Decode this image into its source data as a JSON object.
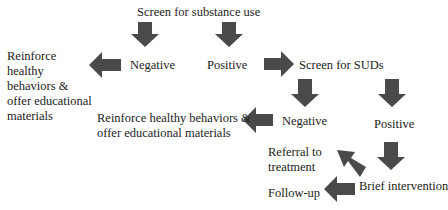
{
  "diagram": {
    "type": "flowchart",
    "arrow_color": "#4a4a4a",
    "nodes": {
      "screen_substance": "Screen for substance use",
      "negative_1": "Negative",
      "positive_1": "Positive",
      "reinforce_1": "Reinforce healthy behaviors & offer educational materials",
      "screen_suds": "Screen for SUDs",
      "negative_2": "Negative",
      "positive_2": "Positive",
      "reinforce_2_line1": "Reinforce healthy behaviors &",
      "reinforce_2_line2": "offer educational materials",
      "referral_line1": "Referral to",
      "referral_line2": "treatment",
      "brief_intervention": "Brief intervention",
      "follow_up": "Follow-up"
    },
    "reinforce_1_lines": [
      "Reinforce",
      "healthy",
      "behaviors &",
      "offer educational",
      "materials"
    ],
    "edges": [
      {
        "from": "Screen for substance use",
        "to": "Negative"
      },
      {
        "from": "Screen for substance use",
        "to": "Positive"
      },
      {
        "from": "Negative",
        "to": "Reinforce healthy behaviors & offer educational materials"
      },
      {
        "from": "Positive",
        "to": "Screen for SUDs"
      },
      {
        "from": "Screen for SUDs",
        "to": "Negative"
      },
      {
        "from": "Screen for SUDs",
        "to": "Positive"
      },
      {
        "from": "Negative",
        "to": "Reinforce healthy behaviors & offer educational materials"
      },
      {
        "from": "Positive",
        "to": "Brief intervention"
      },
      {
        "from": "Brief intervention",
        "to": "Referral to treatment"
      },
      {
        "from": "Brief intervention",
        "to": "Follow-up"
      }
    ]
  }
}
